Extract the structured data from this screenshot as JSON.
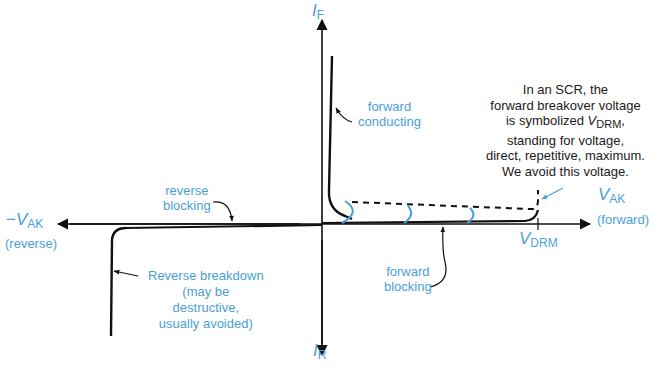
{
  "diagram": {
    "axes": {
      "y_top": {
        "symbol": "I",
        "subscript": "F"
      },
      "y_bottom": {
        "symbol": "I",
        "subscript": "R"
      },
      "x_right": {
        "symbol": "V",
        "subscript": "AK",
        "caption": "(forward)"
      },
      "x_left": {
        "prefix": "−",
        "symbol": "V",
        "subscript": "AK",
        "caption": "(reverse)"
      }
    },
    "tick": {
      "symbol": "V",
      "subscript": "DRM"
    },
    "labels": {
      "forward_conducting": [
        "forward",
        "conducting"
      ],
      "reverse_blocking": [
        "reverse",
        "blocking"
      ],
      "forward_blocking": [
        "forward",
        "blocking"
      ],
      "reverse_breakdown": [
        "Reverse breakdown",
        "(may be",
        "destructive,",
        "usually avoided)"
      ]
    },
    "note": {
      "line1": "In an SCR, the",
      "line2": "forward breakover voltage",
      "line3_prefix": "is symbolized ",
      "line3_symbol": "V",
      "line3_sub": "DRM",
      "line3_suffix": ",",
      "line4": "standing for voltage,",
      "line5": "direct, repetitive, maximum.",
      "line6": "We avoid this voltage."
    },
    "colors": {
      "line": "#111111",
      "accent": "#4a9fd8"
    }
  }
}
